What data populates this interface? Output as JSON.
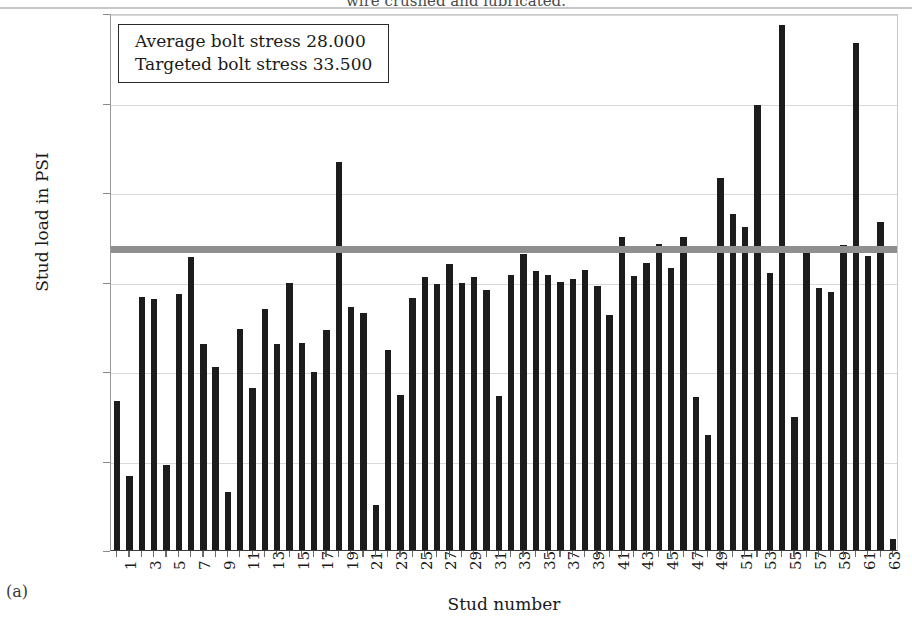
{
  "figure": {
    "cut_title": "wire crushed and lubricated.",
    "caption": "(a)"
  },
  "legend": {
    "line1": "Average bolt stress 28.000",
    "line2": "Targeted bolt stress 33.500"
  },
  "chart_data": {
    "type": "bar",
    "title": "",
    "xlabel": "Stud number",
    "ylabel": "Stud load in PSI",
    "ylim": [
      0,
      60000
    ],
    "yticks": [
      0,
      10000,
      20000,
      30000,
      40000,
      50000,
      60000
    ],
    "ytick_labels": [
      "0",
      "10.000",
      "20.000",
      "30.000",
      "40.000",
      "50.000",
      "60.000"
    ],
    "grid": true,
    "legend_position": "top-left-inside",
    "bar_color": "#1c1c1c",
    "target_line_color": "#8f8f8f",
    "target_line_value": 33800,
    "average_bolt_stress": 28000,
    "targeted_bolt_stress": 33500,
    "categories": [
      1,
      2,
      3,
      4,
      5,
      6,
      7,
      8,
      9,
      10,
      11,
      12,
      13,
      14,
      15,
      16,
      17,
      18,
      19,
      20,
      21,
      22,
      23,
      24,
      25,
      26,
      27,
      28,
      29,
      30,
      31,
      32,
      33,
      34,
      35,
      36,
      37,
      38,
      39,
      40,
      41,
      42,
      43,
      44,
      45,
      46,
      47,
      48,
      49,
      50,
      51,
      52,
      53,
      54,
      55,
      56,
      57,
      58,
      59,
      60,
      61,
      62,
      63,
      64
    ],
    "xtick_labels": [
      "1",
      "",
      "3",
      "",
      "5",
      "",
      "7",
      "",
      "9",
      "",
      "11",
      "",
      "13",
      "",
      "15",
      "",
      "17",
      "",
      "19",
      "",
      "21",
      "",
      "23",
      "",
      "25",
      "",
      "27",
      "",
      "29",
      "",
      "31",
      "",
      "33",
      "",
      "35",
      "",
      "37",
      "",
      "39",
      "",
      "41",
      "",
      "43",
      "",
      "45",
      "",
      "47",
      "",
      "49",
      "",
      "51",
      "",
      "53",
      "",
      "55",
      "",
      "57",
      "",
      "59",
      "",
      "61",
      "",
      "63",
      ""
    ],
    "values": [
      16700,
      8300,
      28300,
      28000,
      9500,
      28600,
      32700,
      23000,
      20500,
      6500,
      24700,
      18100,
      26900,
      23000,
      29800,
      23100,
      19900,
      24600,
      43300,
      27100,
      26500,
      5000,
      22400,
      17300,
      28200,
      30500,
      29700,
      32000,
      29800,
      30500,
      29100,
      17200,
      30700,
      33100,
      31200,
      30700,
      30000,
      30300,
      31300,
      29500,
      26300,
      35000,
      30600,
      32100,
      34200,
      31500,
      35000,
      17100,
      12800,
      41600,
      37500,
      36100,
      49700,
      30900,
      58700,
      14900,
      33400,
      29300,
      28800,
      34100,
      56700,
      32800,
      36700,
      1200
    ]
  }
}
